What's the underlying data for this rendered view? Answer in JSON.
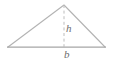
{
  "figure": {
    "name": "triangle-area-diagram",
    "background_color": "#ffffff",
    "stroke_color": "#b3b3b3",
    "base_stroke_color": "#a6a6a6",
    "dash_stroke_color": "#bdbdbd",
    "label_color": "#6d6d6d",
    "geometry": {
      "apex": {
        "x": 64,
        "y": 5
      },
      "left_vertex": {
        "x": 8,
        "y": 47
      },
      "right_vertex": {
        "x": 105,
        "y": 47
      },
      "base_y": 47,
      "height_line": {
        "x": 64,
        "y_top": 5,
        "y_bottom": 47
      }
    },
    "labels": {
      "height": "h",
      "base": "b"
    }
  }
}
